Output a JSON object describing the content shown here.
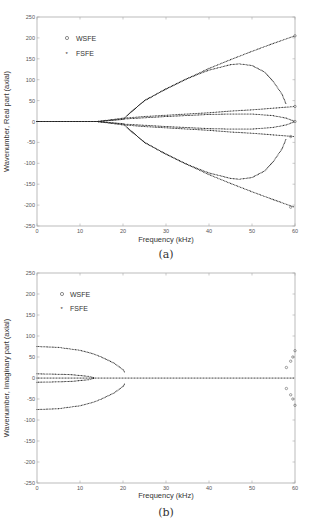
{
  "chart_data": [
    {
      "id": "a",
      "type": "scatter",
      "caption": "(a)",
      "title": "",
      "xlabel": "Frequency (kHz)",
      "ylabel": "Wavenumber, Real part (axial)",
      "xlim": [
        0,
        60
      ],
      "ylim": [
        -250,
        250
      ],
      "xticks": [
        0,
        10,
        20,
        30,
        40,
        50,
        60
      ],
      "yticks": [
        250,
        200,
        150,
        100,
        50,
        0,
        -50,
        -100,
        -150,
        -200,
        -250
      ],
      "grid": false,
      "legend": {
        "position": "upper left",
        "entries": [
          {
            "label": "WSFE",
            "marker": "o"
          },
          {
            "label": "FSFE",
            "marker": "*"
          }
        ]
      },
      "series": [
        {
          "name": "FSFE branch 1 (upper, propagating)",
          "x": [
            0,
            14,
            20,
            21,
            25,
            30,
            35,
            40,
            45,
            50,
            55,
            60
          ],
          "y": [
            0,
            0,
            5,
            15,
            50,
            78,
            103,
            127,
            148,
            168,
            187,
            205
          ]
        },
        {
          "name": "FSFE branch 2 (upper, bends back)",
          "x": [
            21,
            25,
            30,
            35,
            40,
            45,
            47,
            50,
            53,
            55,
            57,
            58
          ],
          "y": [
            15,
            50,
            78,
            103,
            123,
            136,
            138,
            134,
            118,
            95,
            65,
            40
          ]
        },
        {
          "name": "FSFE branch 3 (middle upper)",
          "x": [
            0,
            14,
            17,
            20,
            25,
            30,
            35,
            40,
            45,
            50,
            55,
            60
          ],
          "y": [
            0,
            0,
            4,
            8,
            12,
            15,
            18,
            21,
            25,
            28,
            32,
            36
          ]
        },
        {
          "name": "FSFE branch 4 (middle upper, converges)",
          "x": [
            14,
            20,
            30,
            40,
            45,
            50,
            55,
            58,
            60
          ],
          "y": [
            0,
            6,
            12,
            17,
            18,
            18,
            14,
            8,
            0
          ]
        },
        {
          "name": "FSFE branch 5 (middle lower, converges)",
          "x": [
            14,
            20,
            30,
            40,
            45,
            50,
            55,
            58,
            60
          ],
          "y": [
            0,
            -6,
            -12,
            -17,
            -18,
            -18,
            -14,
            -8,
            0
          ]
        },
        {
          "name": "FSFE branch 6 (middle lower)",
          "x": [
            0,
            14,
            17,
            20,
            25,
            30,
            35,
            40,
            45,
            50,
            55,
            60
          ],
          "y": [
            0,
            0,
            -4,
            -8,
            -12,
            -15,
            -18,
            -21,
            -25,
            -28,
            -32,
            -36
          ]
        },
        {
          "name": "FSFE branch 7 (lower, bends back)",
          "x": [
            21,
            25,
            30,
            35,
            40,
            45,
            47,
            50,
            53,
            55,
            57,
            58
          ],
          "y": [
            -15,
            -50,
            -78,
            -103,
            -123,
            -136,
            -138,
            -134,
            -118,
            -95,
            -65,
            -40
          ]
        },
        {
          "name": "FSFE branch 8 (lower, propagating)",
          "x": [
            0,
            14,
            20,
            21,
            25,
            30,
            35,
            40,
            45,
            50,
            55,
            60
          ],
          "y": [
            0,
            0,
            -5,
            -15,
            -50,
            -78,
            -103,
            -127,
            -148,
            -168,
            -187,
            -205
          ]
        }
      ],
      "wsfe_points": {
        "x": [
          60,
          60,
          60,
          59,
          59
        ],
        "y": [
          205,
          36,
          0,
          -36,
          -205
        ]
      }
    },
    {
      "id": "b",
      "type": "scatter",
      "caption": "(b)",
      "title": "",
      "xlabel": "Frequency (kHz)",
      "ylabel": "Wavenumber, Imaginary part (axial)",
      "xlim": [
        0,
        60
      ],
      "ylim": [
        -250,
        250
      ],
      "xticks": [
        0,
        10,
        20,
        30,
        40,
        50,
        60
      ],
      "yticks": [
        250,
        200,
        150,
        100,
        50,
        0,
        -50,
        -100,
        -150,
        -200,
        -250
      ],
      "grid": false,
      "legend": {
        "position": "upper left",
        "entries": [
          {
            "label": "WSFE",
            "marker": "o"
          },
          {
            "label": "FSFE",
            "marker": "*"
          }
        ]
      },
      "series": [
        {
          "name": "FSFE evanescent upper",
          "x": [
            0,
            5,
            10,
            13,
            15,
            18,
            20,
            20.5
          ],
          "y": [
            75,
            73,
            66,
            58,
            50,
            35,
            20,
            12
          ]
        },
        {
          "name": "FSFE evanescent lower",
          "x": [
            0,
            5,
            10,
            13,
            15,
            18,
            20,
            20.5
          ],
          "y": [
            -75,
            -73,
            -66,
            -58,
            -50,
            -35,
            -20,
            -12
          ]
        },
        {
          "name": "FSFE small upper",
          "x": [
            0,
            5,
            8,
            10,
            12,
            13.5
          ],
          "y": [
            10,
            9,
            8,
            6,
            4,
            0
          ]
        },
        {
          "name": "FSFE small lower",
          "x": [
            0,
            5,
            8,
            10,
            12,
            13.5
          ],
          "y": [
            -10,
            -9,
            -8,
            -6,
            -4,
            0
          ]
        },
        {
          "name": "FSFE zero line",
          "x": [
            0,
            60
          ],
          "y": [
            0,
            0
          ]
        }
      ],
      "wsfe_points": {
        "x": [
          58,
          59,
          59.5,
          60,
          58,
          59,
          59.5,
          60
        ],
        "y": [
          25,
          40,
          50,
          65,
          -25,
          -40,
          -50,
          -65
        ]
      }
    }
  ]
}
